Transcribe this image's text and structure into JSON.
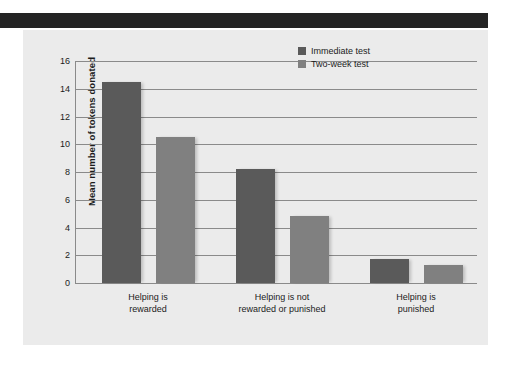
{
  "page": {
    "background_color": "#ffffff",
    "panel_color": "#ebebeb",
    "band_color": "#242424"
  },
  "chart_data": {
    "type": "bar",
    "title": "",
    "subtitle": "",
    "xlabel": "",
    "ylabel": "Mean number of tokens donated",
    "categories": [
      "Helping is\nrewarded",
      "Helping is not\nrewarded or punished",
      "Helping is\npunished"
    ],
    "category_lines": [
      [
        "Helping is",
        "rewarded"
      ],
      [
        "Helping is not",
        "rewarded or punished"
      ],
      [
        "Helping is",
        "punished"
      ]
    ],
    "series": [
      {
        "name": "Immediate test",
        "color": "#5a5a5a",
        "values": [
          14.5,
          8.2,
          1.7
        ]
      },
      {
        "name": "Two-week test",
        "color": "#808080",
        "values": [
          10.5,
          4.8,
          1.3
        ]
      }
    ],
    "ylim": [
      0,
      16
    ],
    "yticks": [
      0,
      2,
      4,
      6,
      8,
      10,
      12,
      14,
      16
    ],
    "ytick_labels": [
      "0",
      "2",
      "4",
      "6",
      "8",
      "10",
      "12",
      "14",
      "16"
    ],
    "grid": true,
    "grid_axis": "y",
    "legend_position": "top-right"
  },
  "legend": {
    "entries": [
      {
        "label": "Immediate test",
        "color": "#5a5a5a"
      },
      {
        "label": "Two-week test",
        "color": "#808080"
      }
    ]
  }
}
